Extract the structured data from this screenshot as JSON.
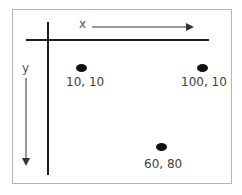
{
  "diagram": {
    "axes": {
      "x_label": "x",
      "y_label": "y"
    },
    "points": [
      {
        "label": "10, 10",
        "x": 10,
        "y": 10
      },
      {
        "label": "100, 10",
        "x": 100,
        "y": 10
      },
      {
        "label": "60, 80",
        "x": 60,
        "y": 80
      }
    ],
    "colors": {
      "axis": "#1c1c1c",
      "point": "#111111",
      "text": "#404040",
      "frame": "#b5b5b5"
    }
  }
}
